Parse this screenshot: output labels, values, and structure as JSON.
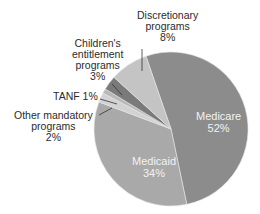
{
  "chart_data": {
    "type": "pie",
    "title": "",
    "categories": [
      "Medicare",
      "Medicaid",
      "Other mandatory programs",
      "TANF",
      "Children's entitlement programs",
      "Discretionary programs"
    ],
    "values": [
      52,
      34,
      2,
      1,
      3,
      8
    ],
    "unit": "%",
    "colors": [
      "#8c8c8c",
      "#a9a9a9",
      "#d2d2d2",
      "#b9b9b9",
      "#7a7a7a",
      "#c4c4c4"
    ],
    "start_angle_deg": -109,
    "direction": "clockwise",
    "center": [
      171,
      129
    ],
    "radius": 77,
    "legend": "none (direct labels)"
  },
  "labels": {
    "discretionary": {
      "line1": "Discretionary",
      "line2": "programs",
      "line3": "8%"
    },
    "childrens": {
      "line1": "Children's",
      "line2": "entitlement",
      "line3": "programs",
      "line4": "3%"
    },
    "tanf": {
      "line1": "TANF 1%"
    },
    "other": {
      "line1": "Other mandatory",
      "line2": "programs",
      "line3": "2%"
    },
    "medicare": {
      "line1": "Medicare",
      "line2": "52%"
    },
    "medicaid": {
      "line1": "Medicaid",
      "line2": "34%"
    }
  }
}
